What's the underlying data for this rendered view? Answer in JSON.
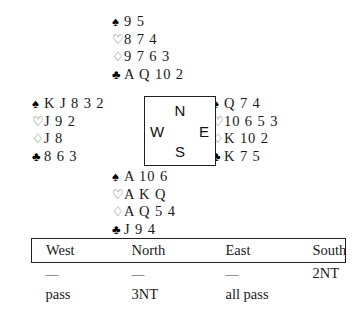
{
  "deal": {
    "suit_symbols": {
      "spade": "♠",
      "heart": "♡",
      "diamond": "♢",
      "club": "♣"
    },
    "hands": {
      "north": {
        "label": "North",
        "spades": "9 5",
        "hearts": "8 7 4",
        "diamonds": "9 7 6 3",
        "clubs": "A Q 10 2"
      },
      "west": {
        "label": "West",
        "spades": "K J 8 3 2",
        "hearts": "J 9 2",
        "diamonds": "J 8",
        "clubs": "8 6 3"
      },
      "east": {
        "label": "East",
        "spades": "Q 7 4",
        "hearts": "10 6 5 3",
        "diamonds": "K 10 2",
        "clubs": "K 7 5"
      },
      "south": {
        "label": "South",
        "spades": "A 10 6",
        "hearts": "A K Q",
        "diamonds": "A Q 5 4",
        "clubs": "J 9 4"
      }
    },
    "compass": {
      "north": "N",
      "south": "S",
      "west": "W",
      "east": "E"
    }
  },
  "auction": {
    "headers": [
      "West",
      "North",
      "East",
      "South"
    ],
    "rows": [
      [
        "—",
        "—",
        "—",
        "2NT"
      ],
      [
        "pass",
        "3NT",
        "all pass",
        ""
      ]
    ]
  }
}
